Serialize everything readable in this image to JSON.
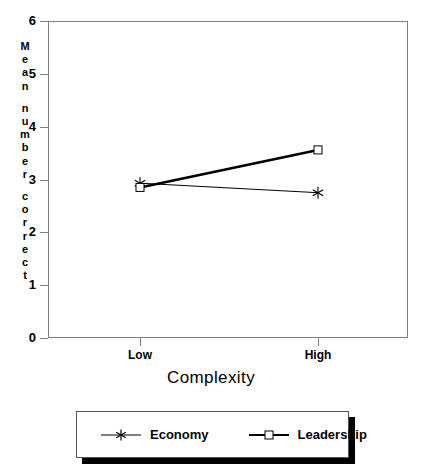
{
  "chart_data": {
    "type": "line",
    "title": "",
    "xlabel": "Complexity",
    "ylabel": "Mean number correct",
    "categories": [
      "Low",
      "High"
    ],
    "ylim": [
      0,
      6
    ],
    "yticks": [
      0,
      1,
      2,
      3,
      4,
      5,
      6
    ],
    "grid": false,
    "legend_position": "bottom",
    "series": [
      {
        "name": "Economy",
        "values": [
          2.93,
          2.75
        ],
        "marker": "asterisk",
        "line": "thin"
      },
      {
        "name": "Leadership",
        "values": [
          2.85,
          3.56
        ],
        "marker": "open-square",
        "line": "thick"
      }
    ]
  },
  "axis": {
    "y_label_chars": [
      "M",
      "e",
      "a",
      "n",
      "",
      "n",
      "u",
      "m",
      "b",
      "e",
      "r",
      "",
      "c",
      "o",
      "r",
      "r",
      "e",
      "c",
      "t"
    ],
    "y_tick_labels": [
      "6",
      "5",
      "4",
      "3",
      "2",
      "1",
      "0"
    ],
    "x_tick_labels": [
      "Low",
      "High"
    ],
    "x_title": "Complexity"
  },
  "legend": {
    "items": [
      {
        "label": "Economy",
        "marker": "asterisk-icon"
      },
      {
        "label": "Leadership",
        "marker": "open-square-icon"
      }
    ]
  },
  "colors": {
    "line": "#000000",
    "frame": "#808080",
    "background": "#ffffff",
    "legend_shadow": "#000000"
  }
}
